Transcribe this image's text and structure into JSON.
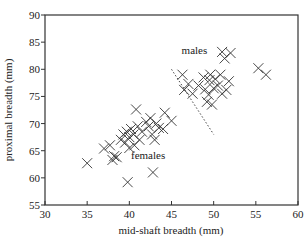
{
  "chart_data": {
    "type": "scatter",
    "title": "",
    "xlabel": "mid-shaft breadth (mm)",
    "ylabel": "proximal breadth (mm)",
    "xlim": [
      30,
      60
    ],
    "ylim": [
      55,
      90
    ],
    "xticks": [
      30,
      35,
      40,
      45,
      50,
      55,
      60
    ],
    "yticks": [
      55,
      60,
      65,
      70,
      75,
      80,
      85,
      90
    ],
    "grid": false,
    "legend": null,
    "marker": "x",
    "series": [
      {
        "name": "females",
        "points": [
          [
            35.0,
            62.7
          ],
          [
            37.0,
            65.4
          ],
          [
            37.7,
            66.0
          ],
          [
            38.0,
            63.3
          ],
          [
            38.2,
            64.0
          ],
          [
            38.5,
            63.8
          ],
          [
            39.0,
            67.0
          ],
          [
            39.3,
            68.0
          ],
          [
            39.5,
            66.5
          ],
          [
            39.7,
            68.5
          ],
          [
            39.8,
            59.2
          ],
          [
            40.0,
            67.5
          ],
          [
            40.2,
            69.0
          ],
          [
            40.0,
            65.5
          ],
          [
            40.5,
            68.0
          ],
          [
            40.6,
            66.0
          ],
          [
            40.8,
            72.6
          ],
          [
            41.0,
            69.5
          ],
          [
            41.2,
            67.0
          ],
          [
            41.5,
            68.5
          ],
          [
            42.0,
            70.3
          ],
          [
            42.3,
            69.5
          ],
          [
            42.5,
            71.0
          ],
          [
            42.7,
            68.0
          ],
          [
            43.0,
            67.0
          ],
          [
            43.2,
            70.0
          ],
          [
            43.5,
            69.2
          ],
          [
            44.0,
            69.0
          ],
          [
            44.2,
            72.0
          ],
          [
            45.0,
            70.5
          ],
          [
            42.8,
            61.0
          ]
        ]
      },
      {
        "name": "males",
        "points": [
          [
            46.3,
            79.0
          ],
          [
            46.5,
            76.2
          ],
          [
            47.0,
            77.3
          ],
          [
            47.5,
            75.5
          ],
          [
            48.2,
            77.0
          ],
          [
            48.8,
            78.5
          ],
          [
            49.0,
            76.3
          ],
          [
            49.2,
            74.0
          ],
          [
            49.4,
            75.3
          ],
          [
            49.5,
            78.0
          ],
          [
            49.8,
            73.5
          ],
          [
            49.6,
            79.0
          ],
          [
            50.0,
            76.5
          ],
          [
            50.2,
            78.2
          ],
          [
            50.5,
            77.0
          ],
          [
            50.8,
            79.0
          ],
          [
            51.0,
            75.5
          ],
          [
            51.0,
            83.2
          ],
          [
            51.3,
            82.0
          ],
          [
            51.5,
            76.2
          ],
          [
            52.0,
            83.0
          ],
          [
            51.8,
            77.8
          ],
          [
            55.3,
            80.2
          ],
          [
            56.2,
            79.0
          ]
        ]
      }
    ],
    "annotations": [
      {
        "text": "males",
        "x": 46.2,
        "y": 82.8
      },
      {
        "text": "females",
        "x": 40.2,
        "y": 63.5
      }
    ],
    "divider_line": {
      "style": "dotted",
      "from": [
        45.0,
        80.0
      ],
      "to": [
        50.0,
        68.0
      ]
    }
  }
}
